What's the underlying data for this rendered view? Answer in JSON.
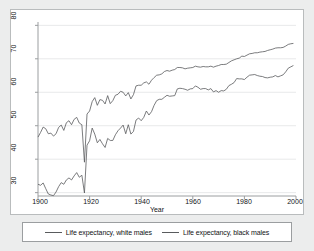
{
  "chart_data": {
    "type": "line",
    "title": "",
    "xlabel": "Year",
    "ylabel": "",
    "xlim": [
      1900,
      2000
    ],
    "ylim": [
      29,
      81
    ],
    "grid": true,
    "grid_axis": "y",
    "legend_position": "bottom",
    "xticks": [
      1900,
      1920,
      1940,
      1960,
      1980,
      2000
    ],
    "yticks": [
      30,
      40,
      50,
      60,
      70,
      80
    ],
    "line_color": "#595b5d",
    "series": [
      {
        "name": "Life expectancy, white males",
        "x": [
          1900,
          1901,
          1902,
          1903,
          1904,
          1905,
          1906,
          1907,
          1908,
          1909,
          1910,
          1911,
          1912,
          1913,
          1914,
          1915,
          1916,
          1917,
          1918,
          1919,
          1920,
          1921,
          1922,
          1923,
          1924,
          1925,
          1926,
          1927,
          1928,
          1929,
          1930,
          1931,
          1932,
          1933,
          1934,
          1935,
          1936,
          1937,
          1938,
          1939,
          1940,
          1941,
          1942,
          1943,
          1944,
          1945,
          1946,
          1947,
          1948,
          1949,
          1950,
          1951,
          1952,
          1953,
          1954,
          1955,
          1956,
          1957,
          1958,
          1959,
          1960,
          1961,
          1962,
          1963,
          1964,
          1965,
          1966,
          1967,
          1968,
          1969,
          1970,
          1971,
          1972,
          1973,
          1974,
          1975,
          1976,
          1977,
          1978,
          1979,
          1980,
          1981,
          1982,
          1983,
          1984,
          1985,
          1986,
          1987,
          1988,
          1989,
          1990,
          1991,
          1992,
          1993,
          1994,
          1995,
          1996,
          1997,
          1998,
          1999
        ],
        "values": [
          46.6,
          48.0,
          49.6,
          49.1,
          47.6,
          47.8,
          46.9,
          47.6,
          49.5,
          50.2,
          48.6,
          50.9,
          51.5,
          50.3,
          51.9,
          52.5,
          50.8,
          50.3,
          39.1,
          53.5,
          54.4,
          57.2,
          58.4,
          56.1,
          57.8,
          57.6,
          56.5,
          59.0,
          56.6,
          57.5,
          59.1,
          59.4,
          60.3,
          60.0,
          58.9,
          59.9,
          58.0,
          59.3,
          61.9,
          62.1,
          62.1,
          62.8,
          63.1,
          62.4,
          63.6,
          64.4,
          65.1,
          65.2,
          65.5,
          66.2,
          66.5,
          66.3,
          66.6,
          66.8,
          67.4,
          67.4,
          67.3,
          67.0,
          67.2,
          67.3,
          67.4,
          67.8,
          67.6,
          67.5,
          67.7,
          67.6,
          67.6,
          67.8,
          67.5,
          67.8,
          68.0,
          68.3,
          68.3,
          68.4,
          68.9,
          69.4,
          69.7,
          70.0,
          70.2,
          70.8,
          70.7,
          71.1,
          71.5,
          71.6,
          71.8,
          71.8,
          72.0,
          72.1,
          72.2,
          72.5,
          72.7,
          72.9,
          73.2,
          73.3,
          73.3,
          73.4,
          73.8,
          74.3,
          74.5,
          74.6
        ]
      },
      {
        "name": "Life expectancy, black males",
        "x": [
          1900,
          1901,
          1902,
          1903,
          1904,
          1905,
          1906,
          1907,
          1908,
          1909,
          1910,
          1911,
          1912,
          1913,
          1914,
          1915,
          1916,
          1917,
          1918,
          1919,
          1920,
          1921,
          1922,
          1923,
          1924,
          1925,
          1926,
          1927,
          1928,
          1929,
          1930,
          1931,
          1932,
          1933,
          1934,
          1935,
          1936,
          1937,
          1938,
          1939,
          1940,
          1941,
          1942,
          1943,
          1944,
          1945,
          1946,
          1947,
          1948,
          1949,
          1950,
          1951,
          1952,
          1953,
          1954,
          1955,
          1956,
          1957,
          1958,
          1959,
          1960,
          1961,
          1962,
          1963,
          1964,
          1965,
          1966,
          1967,
          1968,
          1969,
          1970,
          1971,
          1972,
          1973,
          1974,
          1975,
          1976,
          1977,
          1978,
          1979,
          1980,
          1981,
          1982,
          1983,
          1984,
          1985,
          1986,
          1987,
          1988,
          1989,
          1990,
          1991,
          1992,
          1993,
          1994,
          1995,
          1996,
          1997,
          1998,
          1999
        ],
        "values": [
          32.5,
          32.2,
          32.9,
          31.2,
          29.6,
          29.3,
          29.1,
          30.2,
          31.8,
          33.0,
          32.5,
          33.8,
          34.4,
          33.8,
          35.0,
          36.0,
          34.6,
          35.2,
          29.9,
          44.2,
          45.5,
          49.3,
          47.5,
          44.9,
          45.9,
          44.6,
          43.5,
          46.2,
          45.6,
          45.6,
          47.3,
          48.5,
          49.3,
          50.2,
          47.6,
          50.3,
          47.5,
          48.3,
          51.7,
          52.3,
          51.5,
          52.5,
          54.4,
          53.2,
          54.2,
          56.1,
          57.5,
          57.9,
          57.9,
          58.5,
          59.1,
          58.8,
          58.9,
          59.0,
          61.0,
          61.2,
          61.1,
          60.9,
          60.6,
          61.0,
          61.1,
          61.9,
          61.5,
          60.9,
          61.1,
          61.1,
          60.7,
          61.1,
          60.1,
          60.5,
          60.0,
          60.5,
          60.4,
          60.9,
          62.0,
          62.4,
          62.9,
          64.1,
          64.0,
          64.0,
          63.8,
          64.5,
          65.1,
          65.2,
          65.3,
          65.0,
          64.8,
          64.7,
          64.4,
          64.3,
          64.5,
          64.6,
          65.0,
          64.6,
          64.9,
          65.2,
          66.1,
          67.2,
          67.6,
          68.0
        ]
      }
    ]
  },
  "axis": {
    "x_title": "Year",
    "x_tick_labels": [
      "1900",
      "1920",
      "1940",
      "1960",
      "1980",
      "2000"
    ],
    "y_tick_labels": [
      "30",
      "40",
      "50",
      "60",
      "70",
      "80"
    ]
  },
  "legend": {
    "entries": [
      {
        "label": "Life expectancy, white males"
      },
      {
        "label": "Life expectancy, black males"
      }
    ]
  }
}
